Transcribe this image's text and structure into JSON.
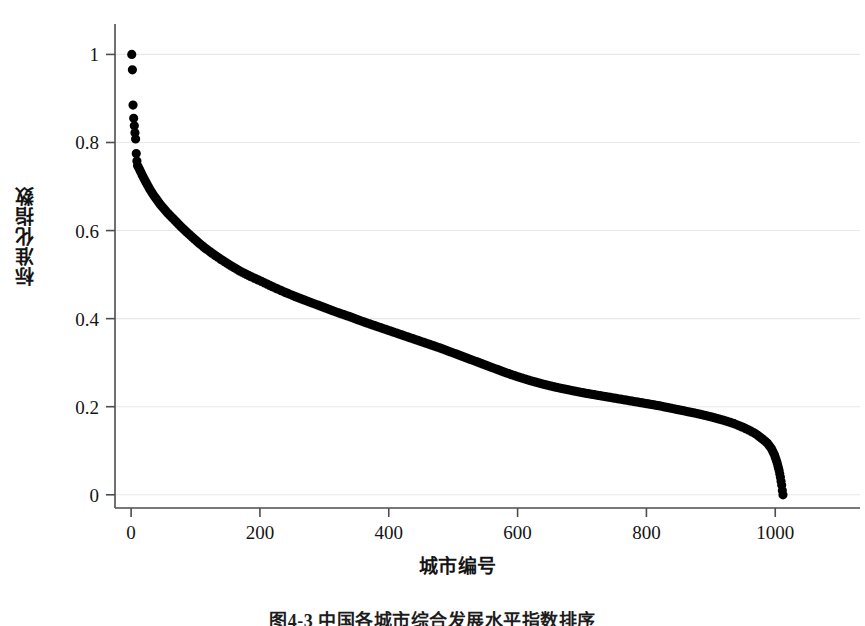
{
  "figure": {
    "caption": "图4-3 中国各城市综合发展水平指数排序",
    "background_color": "#ffffff",
    "marker_color": "#000000",
    "axis_color": "#4d4d4d",
    "grid_color": "#e8e8e8"
  },
  "chart_data": {
    "type": "scatter",
    "title": "",
    "xlabel": "城市编号",
    "ylabel": "标准化指数",
    "xlim": [
      -25,
      1085
    ],
    "ylim": [
      -0.03,
      1.06
    ],
    "grid": true,
    "legend_position": "none",
    "xticks": [
      0,
      200,
      400,
      600,
      800,
      1000
    ],
    "xticklabels": [
      "0",
      "200",
      "400",
      "600",
      "800",
      "1000"
    ],
    "yticks": [
      0,
      0.2,
      0.4,
      0.6,
      0.8,
      1
    ],
    "yticklabels": [
      "0",
      "0.2",
      "0.4",
      "0.6",
      "0.8",
      "1"
    ],
    "marker_size": 6,
    "n_points": 1012,
    "series": [
      {
        "name": "标准化指数",
        "x": [
          1,
          2,
          3,
          4,
          5,
          6,
          7,
          8,
          9,
          10,
          12,
          14,
          16,
          18,
          20,
          23,
          26,
          29,
          32,
          36,
          40,
          45,
          50,
          56,
          62,
          70,
          78,
          86,
          95,
          105,
          115,
          128,
          140,
          155,
          170,
          185,
          200,
          220,
          240,
          260,
          280,
          300,
          320,
          340,
          360,
          380,
          400,
          420,
          440,
          460,
          480,
          500,
          520,
          540,
          560,
          580,
          600,
          620,
          640,
          660,
          680,
          700,
          720,
          740,
          760,
          780,
          800,
          820,
          840,
          860,
          880,
          900,
          920,
          935,
          950,
          960,
          970,
          980,
          988,
          994,
          999,
          1003,
          1006,
          1008,
          1010,
          1011,
          1012
        ],
        "y": [
          1.0,
          0.965,
          0.885,
          0.855,
          0.838,
          0.822,
          0.808,
          0.775,
          0.758,
          0.748,
          0.742,
          0.736,
          0.73,
          0.724,
          0.718,
          0.71,
          0.702,
          0.694,
          0.687,
          0.678,
          0.67,
          0.66,
          0.651,
          0.641,
          0.632,
          0.62,
          0.608,
          0.597,
          0.585,
          0.572,
          0.56,
          0.546,
          0.534,
          0.52,
          0.507,
          0.496,
          0.486,
          0.472,
          0.459,
          0.447,
          0.436,
          0.425,
          0.414,
          0.404,
          0.393,
          0.383,
          0.373,
          0.363,
          0.353,
          0.343,
          0.333,
          0.322,
          0.311,
          0.3,
          0.289,
          0.278,
          0.268,
          0.259,
          0.251,
          0.244,
          0.238,
          0.232,
          0.227,
          0.222,
          0.217,
          0.212,
          0.207,
          0.202,
          0.196,
          0.19,
          0.184,
          0.177,
          0.169,
          0.162,
          0.153,
          0.146,
          0.138,
          0.127,
          0.117,
          0.105,
          0.09,
          0.072,
          0.055,
          0.04,
          0.022,
          0.01,
          0.0
        ]
      }
    ]
  },
  "axes_geometry": {
    "plot_left_px": 115,
    "plot_right_px": 830,
    "plot_top_px": 28,
    "plot_bottom_px": 508,
    "y_top_value": 1.06,
    "y_bottom_value": -0.03,
    "x_left_value": -25,
    "x_right_value": 1085
  }
}
